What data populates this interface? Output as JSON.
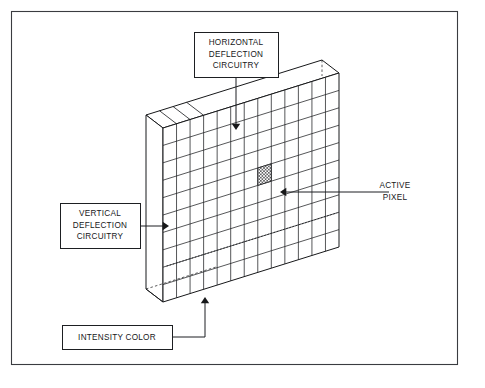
{
  "figure": {
    "background_color": "#ffffff",
    "line_color": "#17181a",
    "frame": {
      "x": 11,
      "y": 11,
      "width": 447,
      "height": 354
    }
  },
  "callouts": [
    {
      "id": "horizontal-deflection",
      "name": "horizontal-deflection-circuitry",
      "boxed": true,
      "lines": [
        "HORIZONTAL",
        "DEFLECTION",
        "CIRCUITRY"
      ],
      "box": {
        "x": 194,
        "y": 32,
        "width": 84,
        "height": 45
      },
      "text_anchor_x": 236,
      "text_start_y": 45,
      "line_height": 11.6,
      "leader": "M236,77 L236,127",
      "arrow": {
        "x": 236,
        "y": 130,
        "dir": "down"
      }
    },
    {
      "id": "vertical-deflection",
      "name": "vertical-deflection-circuitry",
      "boxed": true,
      "lines": [
        "VERTICAL",
        "DEFLECTION",
        "CIRCUITRY"
      ],
      "box": {
        "x": 60,
        "y": 203,
        "width": 80,
        "height": 45
      },
      "text_anchor_x": 100,
      "text_start_y": 216,
      "line_height": 11.6,
      "leader": "M140,226 L166,226",
      "arrow": {
        "x": 169,
        "y": 226,
        "dir": "right"
      }
    },
    {
      "id": "intensity-color",
      "name": "intensity-color",
      "boxed": true,
      "lines": [
        "INTENSITY COLOR"
      ],
      "box": {
        "x": 62,
        "y": 325,
        "width": 110,
        "height": 24
      },
      "text_anchor_x": 117,
      "text_start_y": 340,
      "line_height": 11.6,
      "leader": "M172,337 L205,337 L205,300",
      "arrow": {
        "x": 205,
        "y": 297,
        "dir": "up"
      }
    },
    {
      "id": "active-pixel",
      "name": "active-pixel",
      "boxed": false,
      "lines": [
        "ACTIVE",
        "PIXEL"
      ],
      "box": null,
      "text_anchor_x": 395,
      "text_start_y": 188,
      "line_height": 11.6,
      "leader": "M389,192 L283,192",
      "arrow": {
        "x": 280,
        "y": 192,
        "dir": "left"
      }
    }
  ],
  "screen": {
    "name": "display-screen-slab",
    "projection": "isometric",
    "columns": 13,
    "rows": 10,
    "front_face": {
      "top_left": {
        "x": 163,
        "y": 128
      },
      "top_right": {
        "x": 339,
        "y": 73
      },
      "bottom_right": {
        "x": 339,
        "y": 247
      },
      "bottom_left": {
        "x": 163,
        "y": 302
      }
    },
    "depth": {
      "dx": -17,
      "dy": -13
    },
    "slab_color": "#ffffff",
    "grid_color": "#1d1f22"
  },
  "active_pixel": {
    "name": "active-pixel-cell",
    "column_index": 7,
    "row_index": 4,
    "fill_pattern": "cross-hatch",
    "hatch_spacing": 2.4
  },
  "scanline": {
    "name": "intensity-scanline",
    "description": "dotted raster scan line near bottom of screen",
    "row_index": 8,
    "style": "dotted"
  }
}
